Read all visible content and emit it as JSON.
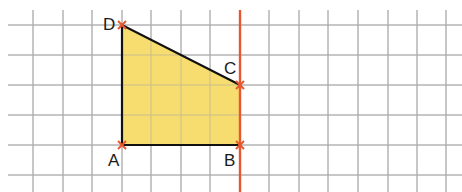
{
  "grid": {
    "x_lines": [
      33,
      63,
      92,
      122,
      151,
      181,
      210,
      240,
      269,
      299,
      328,
      358,
      388,
      417,
      446
    ],
    "y_lines": [
      25,
      55,
      85,
      115,
      145,
      175
    ],
    "color": "#a8a8a8"
  },
  "shape": {
    "type": "trapezoid",
    "fill": "#f7dc6f",
    "stroke": "#111111",
    "vertices": [
      {
        "name": "A",
        "x": 122,
        "y": 145
      },
      {
        "name": "B",
        "x": 240,
        "y": 145
      },
      {
        "name": "C",
        "x": 240,
        "y": 85
      },
      {
        "name": "D",
        "x": 122,
        "y": 25
      }
    ]
  },
  "labels": {
    "A": "A",
    "B": "B",
    "C": "C",
    "D": "D"
  },
  "red_line": {
    "x": 240,
    "y_start": 10,
    "y_end": 192,
    "color": "#e8572f"
  },
  "marker_color": "#e8572f"
}
